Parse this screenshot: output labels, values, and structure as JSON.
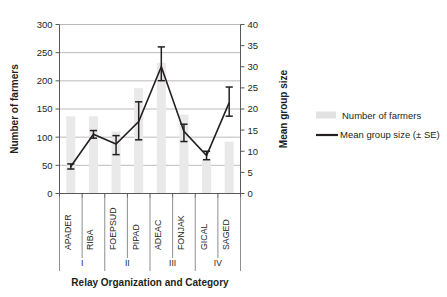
{
  "chart_data": {
    "type": "bar",
    "title": "",
    "subtitle": "",
    "xlabel": "Relay Organization and Category",
    "ylabel": "Number of farmers",
    "y2label": "Mean group size",
    "categories": [
      "APADER",
      "RIBA",
      "FOEPSUD",
      "PIPAD",
      "ADEAC",
      "FONJAK",
      "GICAL",
      "SAGED"
    ],
    "groups": [
      {
        "label": "I",
        "members": [
          "APADER",
          "RIBA"
        ]
      },
      {
        "label": "II",
        "members": [
          "FOEPSUD",
          "PIPAD"
        ]
      },
      {
        "label": "III",
        "members": [
          "ADEAC",
          "FONJAK"
        ]
      },
      {
        "label": "IV",
        "members": [
          "GICAL",
          "SAGED"
        ]
      }
    ],
    "ylim": [
      0,
      300
    ],
    "yticks": [
      0,
      50,
      100,
      150,
      200,
      250,
      300
    ],
    "y2lim": [
      0,
      40
    ],
    "y2ticks": [
      0,
      5,
      10,
      15,
      20,
      25,
      30,
      35,
      40
    ],
    "grid": true,
    "legend_position": "right",
    "series": [
      {
        "name": "Number of farmers",
        "type": "bar",
        "axis": "left",
        "color": "#e9e9e9",
        "values": [
          137,
          137,
          110,
          187,
          232,
          140,
          60,
          92
        ]
      },
      {
        "name": "Mean group size (± SE)",
        "type": "line",
        "axis": "right",
        "color": "#231f20",
        "values": [
          6.4,
          14.0,
          11.7,
          17.0,
          30.0,
          14.7,
          9.0,
          21.5
        ],
        "error_upper": [
          7.0,
          14.9,
          13.7,
          21.7,
          34.7,
          16.4,
          10.0,
          25.2
        ],
        "error_lower": [
          5.8,
          13.1,
          9.2,
          12.7,
          26.7,
          12.3,
          8.0,
          18.3
        ]
      }
    ]
  },
  "legend": {
    "items": [
      {
        "label": "Number of farmers",
        "marker": "swatch"
      },
      {
        "label": "Mean group size (± SE)",
        "marker": "line"
      }
    ]
  },
  "axis_labels": {
    "left_ticks": [
      "0",
      "50",
      "100",
      "150",
      "200",
      "250",
      "300"
    ],
    "right_ticks": [
      "0",
      "5",
      "10",
      "15",
      "20",
      "25",
      "30",
      "35",
      "40"
    ],
    "left_title": "Number of farmers",
    "right_title": "Mean group size",
    "bottom_title": "Relay Organization and Category"
  }
}
